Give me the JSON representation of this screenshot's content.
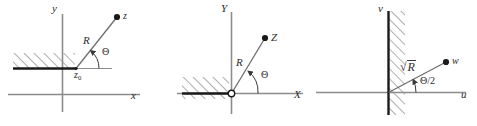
{
  "figure": {
    "background_color": "#ffffff",
    "axis_color": "#8c8c8c",
    "ray_color": "#6e6e6e",
    "barrier_color": "#1a1a1a",
    "hatch_color": "#5a5a5a",
    "label_color": "#2b2b2b",
    "point_color": "#1a1a1a"
  },
  "panels": [
    {
      "id": "z-plane",
      "name": "z-plane",
      "axes": {
        "vertical_label": "y",
        "horizontal_label": "x"
      },
      "point": {
        "label": "z",
        "origin_label": "z",
        "origin_sub": "0"
      },
      "ray_label": "R",
      "angle_label": "Θ",
      "barrier": {
        "type": "horizontal-half-line",
        "hatch_direction": "up-right",
        "hatch_side": "above"
      }
    },
    {
      "id": "Z-plane",
      "name": "Z-plane",
      "axes": {
        "vertical_label": "Y",
        "horizontal_label": "X"
      },
      "point": {
        "label": "Z"
      },
      "ray_label": "R",
      "angle_label": "Θ",
      "origin_marker": "open-circle",
      "barrier": {
        "type": "horizontal-half-line",
        "hatch_direction": "up-right",
        "hatch_side": "both"
      }
    },
    {
      "id": "w-plane",
      "name": "w-plane",
      "axes": {
        "vertical_label": "v",
        "horizontal_label": "u"
      },
      "point": {
        "label": "w"
      },
      "ray_label_radical": "√",
      "ray_label_radicand": "R",
      "angle_label": "Θ/2",
      "barrier": {
        "type": "vertical-full-line",
        "hatch_direction": "up-right",
        "hatch_side": "right"
      }
    }
  ]
}
